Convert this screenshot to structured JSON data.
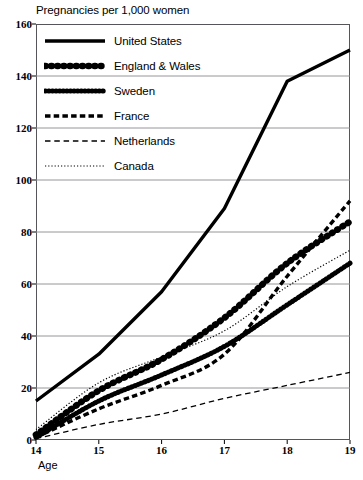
{
  "chart_data": {
    "type": "line",
    "title": "Pregnancies per 1,000 women",
    "xlabel": "Age",
    "ylabel": "",
    "xlim": [
      14,
      19
    ],
    "ylim": [
      0,
      160
    ],
    "xticks": [
      "14",
      "15",
      "16",
      "17",
      "18",
      "19"
    ],
    "yticks": [
      "0",
      "20",
      "40",
      "60",
      "80",
      "100",
      "120",
      "140",
      "160"
    ],
    "grid": "horizontal",
    "legend_position": "upper-left-inside",
    "x": [
      14,
      15,
      16,
      17,
      18,
      19
    ],
    "series": [
      {
        "name": "United States",
        "style": "solid-thick",
        "values": [
          15,
          33,
          57,
          89,
          138,
          150
        ]
      },
      {
        "name": "England & Wales",
        "style": "large-dots",
        "values": [
          2,
          19,
          31,
          47,
          68,
          84
        ]
      },
      {
        "name": "Sweden",
        "style": "small-dots-thick",
        "values": [
          1,
          15,
          25,
          36,
          52,
          68
        ]
      },
      {
        "name": "France",
        "style": "thick-dash",
        "values": [
          1,
          12,
          21,
          33,
          63,
          92
        ]
      },
      {
        "name": "Netherlands",
        "style": "thin-dash",
        "values": [
          0.5,
          6,
          10,
          16,
          21,
          26
        ]
      },
      {
        "name": "Canada",
        "style": "dotted",
        "values": [
          4,
          22,
          32,
          42,
          59,
          73
        ]
      }
    ]
  },
  "axis": {
    "x_name": "Age"
  }
}
